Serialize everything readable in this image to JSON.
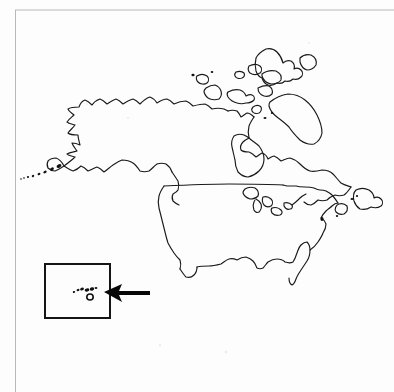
{
  "figure": {
    "type": "line-art map",
    "title": "North America outline map with Hawaii inset",
    "background_color": "#fdfdfd",
    "ink_color": "#1a1a1a",
    "scan_edge_color": "#b8b8bb",
    "width": 394,
    "height": 392
  },
  "scan_edges": {
    "top_rule_label": "scan-edge-top",
    "left_rule_label": "scan-edge-left"
  },
  "map": {
    "name": "north-america-outline",
    "regions": [
      {
        "name": "alaska",
        "label": "Alaska"
      },
      {
        "name": "aleutian-islands",
        "label": "Aleutian Islands"
      },
      {
        "name": "canada-mainland",
        "label": "Canada"
      },
      {
        "name": "canadian-arctic-archipelago",
        "label": "Canadian Arctic Archipelago"
      },
      {
        "name": "hudson-bay",
        "label": "Hudson Bay"
      },
      {
        "name": "greenland-edge",
        "label": "Greenland"
      },
      {
        "name": "contiguous-united-states",
        "label": "Contiguous United States"
      },
      {
        "name": "great-lakes",
        "label": "Great Lakes"
      },
      {
        "name": "florida-peninsula",
        "label": "Florida"
      },
      {
        "name": "newfoundland",
        "label": "Newfoundland"
      },
      {
        "name": "nova-scotia",
        "label": "Nova Scotia"
      },
      {
        "name": "baja-california",
        "label": "Baja California"
      }
    ],
    "us_canada_border_label": "49th parallel border"
  },
  "inset": {
    "name": "hawaii-inset",
    "label": "Hawaii inset box",
    "frame_color": "#151515",
    "contents_label": "Hawaiian Islands",
    "islands": [
      {
        "name": "kauai"
      },
      {
        "name": "oahu"
      },
      {
        "name": "molokai"
      },
      {
        "name": "maui"
      },
      {
        "name": "lanai"
      },
      {
        "name": "hawaii-big-island"
      }
    ]
  },
  "annotation": {
    "name": "pointer-arrow",
    "label": "Arrow pointing to Hawaii inset",
    "direction": "left",
    "color": "#080808"
  }
}
